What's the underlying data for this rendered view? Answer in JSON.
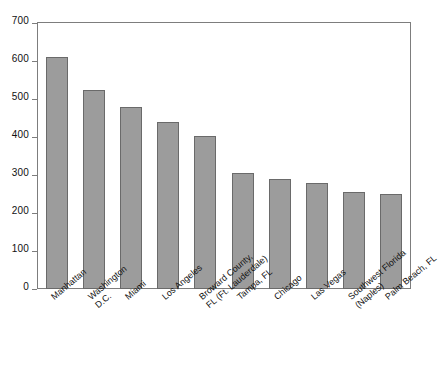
{
  "chart_data": {
    "type": "bar",
    "title": "",
    "subtitle": "",
    "xlabel": "",
    "ylabel": "",
    "ylim": [
      0,
      700
    ],
    "ytick_step": 100,
    "yticks": [
      0,
      100,
      200,
      300,
      400,
      500,
      600,
      700
    ],
    "grid": false,
    "legend": false,
    "bar_color": "#9c9c9c",
    "bar_border_color": "#6a6a6a",
    "axis_color": "#7d7d7d",
    "categories": [
      "Manhattan",
      "Washington D.C.",
      "Miami",
      "Los Angeles",
      "Broward County, FL (Ft. Lauderdale)",
      "Tampa, FL",
      "Chicago",
      "Las Vegas",
      "Southwest Florida (Naples)",
      "Palm Beach, FL"
    ],
    "category_lines": [
      [
        "Manhattan"
      ],
      [
        "Washington",
        "D.C."
      ],
      [
        "Miami"
      ],
      [
        "Los Angeles"
      ],
      [
        "Broward County,",
        "FL (Ft. Lauderdale)"
      ],
      [
        "Tampa, FL"
      ],
      [
        "Chicago"
      ],
      [
        "Las Vegas"
      ],
      [
        "Southwest Florida",
        "(Naples)"
      ],
      [
        "Palm Beach, FL"
      ]
    ],
    "values": [
      610,
      525,
      480,
      440,
      403,
      305,
      290,
      280,
      255,
      250
    ]
  }
}
